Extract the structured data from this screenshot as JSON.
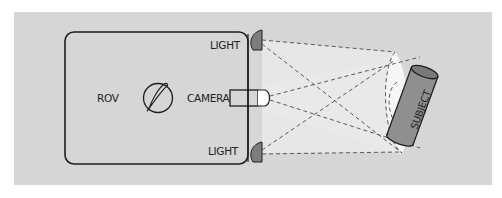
{
  "diagram": {
    "labels": {
      "rov": "ROV",
      "camera": "CAMERA",
      "light_top": "LIGHT",
      "light_bottom": "LIGHT",
      "subject": "SUBJECT"
    },
    "colors": {
      "panel": "#d6d6d6",
      "light_beam": "#ececec",
      "light_housing": "#7d7d7d",
      "subject_body": "#8f8f8f",
      "subject_top": "#7a7a7a",
      "outline": "#1e1e1e",
      "dashed": "#5a5a5a"
    }
  }
}
